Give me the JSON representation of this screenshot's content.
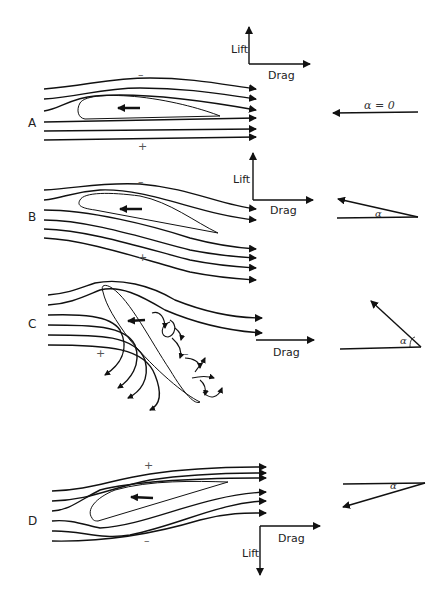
{
  "figure": {
    "type": "airfoil streamline diagram",
    "panels": [
      {
        "id": "A",
        "label": "A",
        "upper_sign": "–",
        "lower_sign": "+",
        "angle_label": "α = 0",
        "force_labels": {
          "lift": "Lift",
          "drag": "Drag"
        },
        "lift_direction": "up"
      },
      {
        "id": "B",
        "label": "B",
        "upper_sign": "–",
        "lower_sign": "+",
        "angle_label": "α",
        "force_labels": {
          "lift": "Lift",
          "drag": "Drag"
        },
        "lift_direction": "up"
      },
      {
        "id": "C",
        "label": "C",
        "upper_sign": "–",
        "lower_sign": "+",
        "angle_label": "α",
        "force_labels": {
          "drag": "Drag"
        },
        "flow_state": "stalled / turbulent"
      },
      {
        "id": "D",
        "label": "D",
        "upper_sign": "+",
        "lower_sign": "–",
        "angle_label": "α",
        "force_labels": {
          "lift": "Lift",
          "drag": "Drag"
        },
        "lift_direction": "down"
      }
    ]
  },
  "colors": {
    "line": "#111111",
    "background": "#ffffff"
  }
}
